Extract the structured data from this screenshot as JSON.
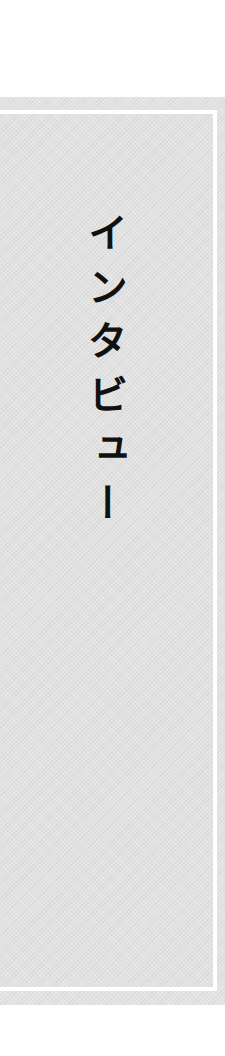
{
  "page": {
    "background_color": "#ffffff",
    "band_color": "#e3e3e3",
    "frame_color": "#ffffff",
    "text_color": "#111111"
  },
  "heading": {
    "text": "インタビュー",
    "orientation": "vertical"
  }
}
